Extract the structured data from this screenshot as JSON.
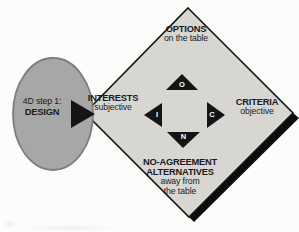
{
  "ellipse": {
    "line1": "4D step 1:",
    "line2": "DESIGN"
  },
  "diamond": {
    "top": {
      "title": "OPTIONS",
      "subtitle": "on the table",
      "marker": "O"
    },
    "left": {
      "title": "INTERESTS",
      "subtitle": "subjective",
      "marker": "I"
    },
    "right": {
      "title": "CRITERIA",
      "subtitle": "objective",
      "marker": "C"
    },
    "bottom": {
      "title1": "NO-AGREEMENT",
      "title2": "ALTERNATIVES",
      "subtitle1": "away from",
      "subtitle2": "the table",
      "marker": "N"
    }
  },
  "colors": {
    "background": "#fcfcfb",
    "ellipse_fill": "#a7a7a7",
    "ellipse_stroke": "#7d7d7d",
    "diamond_fill": "#d7d6d3",
    "outline": "#161616",
    "shadow": "#0d0d0d",
    "arrow_fill": "#141414",
    "text": "#1b1b1b",
    "marker_text": "#ffffff"
  }
}
